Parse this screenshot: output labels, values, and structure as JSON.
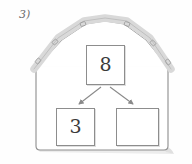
{
  "worksheet": {
    "problem_number": "3)",
    "background_color": "#fefefe"
  },
  "illustration": {
    "name": "barn",
    "body_color": "#ffffff",
    "outline_color": "#8d8d8d",
    "roof_band_color": "#d9d9d9",
    "roof_band_outline_color": "#a8a8a8",
    "shadow_color": "#e3e3e3",
    "roof_shingle_marks": 6
  },
  "number_bond": {
    "whole": {
      "label": "8",
      "role": "whole"
    },
    "parts": [
      {
        "label": "3",
        "role": "part-known"
      },
      {
        "label": "",
        "role": "part-blank"
      }
    ],
    "arrow_color": "#8a8a8a",
    "box_border_color": "#8d8d8d",
    "box_fill_color": "#ffffff",
    "text_color": "#3a3a3a"
  }
}
